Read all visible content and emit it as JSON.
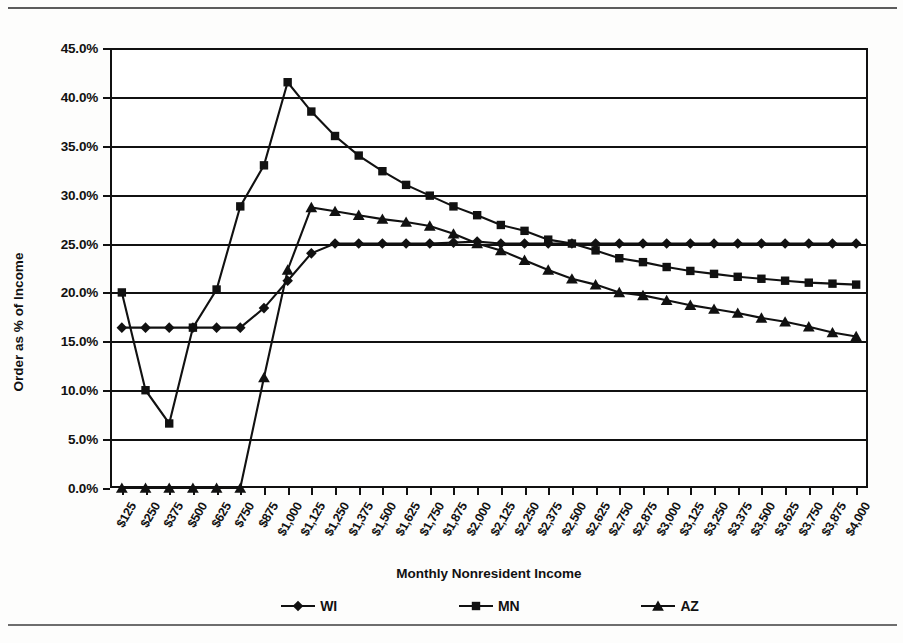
{
  "chart_data": {
    "type": "line",
    "title": "",
    "xlabel": "Monthly Nonresident Income",
    "ylabel": "Order as % of Income",
    "ylim": [
      0,
      45
    ],
    "ytick_step": 5,
    "grid": "horizontal",
    "legend_position": "bottom",
    "x_is_categorical": true,
    "categories": [
      "$125",
      "$250",
      "$375",
      "$500",
      "$625",
      "$750",
      "$875",
      "$1,000",
      "$1,125",
      "$1,250",
      "$1,375",
      "$1,500",
      "$1,625",
      "$1,750",
      "$1,875",
      "$2,000",
      "$2,125",
      "$2,250",
      "$2,375",
      "$2,500",
      "$2,625",
      "$2,750",
      "$2,875",
      "$3,000",
      "$3,125",
      "$3,250",
      "$3,375",
      "$3,500",
      "$3,625",
      "$3,750",
      "$3,875",
      "$4,000"
    ],
    "ytick_labels": [
      "0.0%",
      "5.0%",
      "10.0%",
      "15.0%",
      "20.0%",
      "25.0%",
      "30.0%",
      "35.0%",
      "40.0%",
      "45.0%"
    ],
    "series": [
      {
        "name": "WI",
        "marker": "diamond",
        "color": "#111111",
        "values": [
          16.4,
          16.4,
          16.4,
          16.4,
          16.4,
          16.4,
          18.4,
          21.2,
          24.0,
          25.0,
          25.0,
          25.0,
          25.0,
          25.0,
          25.1,
          25.2,
          25.0,
          25.0,
          25.0,
          25.0,
          25.0,
          25.0,
          25.0,
          25.0,
          25.0,
          25.0,
          25.0,
          25.0,
          25.0,
          25.0,
          25.0,
          25.0
        ]
      },
      {
        "name": "MN",
        "marker": "square",
        "color": "#111111",
        "values": [
          20.0,
          10.0,
          6.6,
          16.4,
          20.3,
          28.8,
          33.0,
          41.5,
          38.5,
          36.0,
          34.0,
          32.4,
          31.0,
          29.9,
          28.8,
          27.9,
          26.9,
          26.3,
          25.4,
          25.0,
          24.3,
          23.5,
          23.1,
          22.6,
          22.2,
          21.9,
          21.6,
          21.4,
          21.2,
          21.0,
          20.9,
          20.8
        ]
      },
      {
        "name": "AZ",
        "marker": "triangle",
        "color": "#111111",
        "values": [
          0.0,
          0.0,
          0.0,
          0.0,
          0.0,
          0.0,
          11.3,
          22.3,
          28.7,
          28.3,
          27.9,
          27.5,
          27.2,
          26.8,
          26.0,
          25.0,
          24.3,
          23.3,
          22.3,
          21.4,
          20.8,
          20.0,
          19.7,
          19.2,
          18.7,
          18.3,
          17.9,
          17.4,
          17.0,
          16.5,
          15.9,
          15.5
        ]
      }
    ]
  },
  "legend": {
    "items": [
      {
        "label": "WI",
        "marker": "diamond"
      },
      {
        "label": "MN",
        "marker": "square"
      },
      {
        "label": "AZ",
        "marker": "triangle"
      }
    ]
  }
}
